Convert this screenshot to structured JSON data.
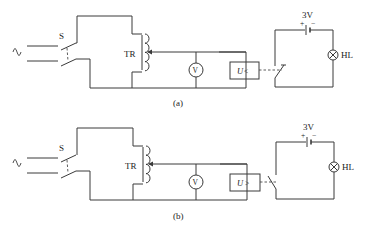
{
  "figure": {
    "panels": [
      {
        "id": "a",
        "caption": "(a)",
        "switch_label": "S",
        "transformer_label": "TR",
        "voltmeter_label": "V",
        "relay_label_var": "U",
        "relay_label_op": "<",
        "battery_label": "3V",
        "battery_plus": "+",
        "battery_minus": "−",
        "lamp_label": "HL",
        "relay_contact": "closed"
      },
      {
        "id": "b",
        "caption": "(b)",
        "switch_label": "S",
        "transformer_label": "TR",
        "voltmeter_label": "V",
        "relay_label_var": "U",
        "relay_label_op": ">",
        "battery_label": "3V",
        "battery_plus": "+",
        "battery_minus": "−",
        "lamp_label": "HL",
        "relay_contact": "open"
      }
    ],
    "ac_source_symbol": "~"
  }
}
